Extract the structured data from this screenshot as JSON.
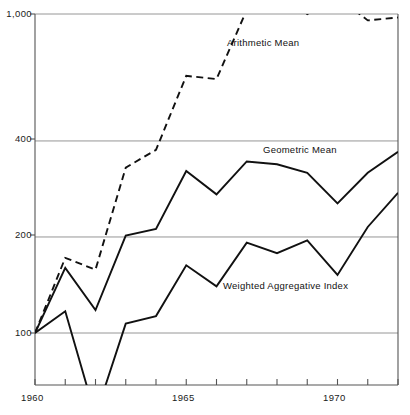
{
  "chart_data": {
    "type": "line",
    "title": "",
    "xlabel": "",
    "ylabel": "",
    "yscale": "log",
    "ylim": [
      50,
      1000
    ],
    "xlim": [
      1960,
      1972
    ],
    "grid": true,
    "gridlines": [
      100,
      200,
      400,
      1000
    ],
    "ytick_labels": [
      "100",
      "200",
      "400",
      "1,000"
    ],
    "xtick_values": [
      1960,
      1961,
      1962,
      1963,
      1964,
      1965,
      1966,
      1967,
      1968,
      1969,
      1970,
      1971,
      1972
    ],
    "xtick_labels": [
      "1960",
      "",
      "",
      "",
      "",
      "1965",
      "",
      "",
      "",
      "",
      "1970",
      "",
      ""
    ],
    "legend_position": "inline-annotations",
    "x": [
      1960,
      1961,
      1962,
      1963,
      1964,
      1965,
      1966,
      1967,
      1968,
      1969,
      1970,
      1971,
      1972
    ],
    "series": [
      {
        "name": "Arithmetic Mean",
        "style": "dashed",
        "clipped_above": 1000,
        "values": [
          100,
          172,
          158,
          330,
          375,
          640,
          625,
          1030,
          1210,
          1000,
          1130,
          955,
          975
        ]
      },
      {
        "name": "Geometric Mean",
        "style": "solid",
        "values": [
          100,
          160,
          118,
          202,
          212,
          322,
          272,
          345,
          338,
          318,
          255,
          318,
          370
        ]
      },
      {
        "name": "Weighted Aggregative Index",
        "style": "solid",
        "values": [
          100,
          117,
          55,
          107,
          113,
          163,
          140,
          192,
          178,
          195,
          152,
          215,
          275
        ]
      }
    ]
  },
  "annotations": [
    {
      "text": "Arithmetic Mean",
      "x_px": 227,
      "y_px": 44
    },
    {
      "text": "Geometric Mean",
      "x_px": 263,
      "y_px": 151
    },
    {
      "text": "Weighted Aggregative Index",
      "x_px": 223,
      "y_px": 287
    }
  ],
  "axis_ticks": {
    "y": [
      {
        "label": "1,000",
        "y_px": 14
      },
      {
        "label": "400",
        "y_px": 139
      },
      {
        "label": "200",
        "y_px": 235
      },
      {
        "label": "100",
        "y_px": 333
      }
    ],
    "x": [
      {
        "label": "1960",
        "x_px": 35
      },
      {
        "label": "1965",
        "x_px": 186
      },
      {
        "label": "1970",
        "x_px": 337
      }
    ]
  },
  "colors": {
    "ink": "#111111",
    "grid": "#8a8a8a",
    "axis": "#555555",
    "background": "#ffffff"
  }
}
